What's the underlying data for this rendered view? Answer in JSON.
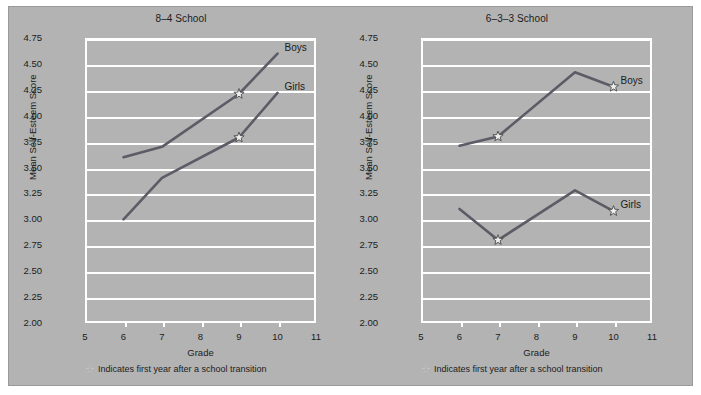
{
  "figure": {
    "background_color": "#b3b3b3",
    "line_color": "#5c5c66",
    "grid_color": "#ffffff",
    "footnote": "Indicates first year after a school transition",
    "star_glyph": "☆"
  },
  "chart_data": [
    {
      "type": "line",
      "title": "8–4 School",
      "xlabel": "Grade",
      "ylabel": "Mean Self-Esteem Score",
      "xlim": [
        5,
        11
      ],
      "ylim": [
        2.0,
        4.75
      ],
      "xticks": [
        "5",
        "6",
        "7",
        "8",
        "9",
        "10",
        "11"
      ],
      "yticks": [
        "2.00",
        "2.25",
        "2.50",
        "2.75",
        "3.00",
        "3.25",
        "3.50",
        "3.75",
        "4.00",
        "4.25",
        "4.50",
        "4.75"
      ],
      "grid": true,
      "legend_position": "inline-right",
      "x": [
        6,
        7,
        9,
        10
      ],
      "series": [
        {
          "name": "Boys",
          "values": [
            3.6,
            3.7,
            4.21,
            4.6
          ],
          "star_points": [
            9
          ]
        },
        {
          "name": "Girls",
          "values": [
            3.0,
            3.4,
            3.79,
            4.22
          ],
          "star_points": [
            9
          ]
        }
      ]
    },
    {
      "type": "line",
      "title": "6–3–3 School",
      "xlabel": "Grade",
      "ylabel": "Mean Self-Esteem Score",
      "xlim": [
        5,
        11
      ],
      "ylim": [
        2.0,
        4.75
      ],
      "xticks": [
        "5",
        "6",
        "7",
        "8",
        "9",
        "10",
        "11"
      ],
      "yticks": [
        "2.00",
        "2.25",
        "2.50",
        "2.75",
        "3.00",
        "3.25",
        "3.50",
        "3.75",
        "4.00",
        "4.25",
        "4.50",
        "4.75"
      ],
      "grid": true,
      "legend_position": "inline-right",
      "x": [
        6,
        7,
        9,
        10
      ],
      "series": [
        {
          "name": "Boys",
          "values": [
            3.71,
            3.8,
            4.42,
            4.28
          ],
          "star_points": [
            7,
            10
          ]
        },
        {
          "name": "Girls",
          "values": [
            3.1,
            2.8,
            3.28,
            3.08
          ],
          "star_points": [
            7,
            10
          ]
        }
      ]
    }
  ]
}
